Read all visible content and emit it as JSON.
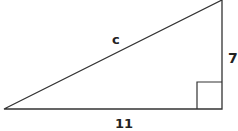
{
  "diagram": {
    "type": "right-triangle",
    "labels": {
      "hypotenuse": "c",
      "vertical_leg": "7",
      "horizontal_leg": "11"
    },
    "colors": {
      "stroke": "#333333",
      "text": "#222222",
      "background": "#ffffff"
    },
    "right_angle_marker": true
  }
}
